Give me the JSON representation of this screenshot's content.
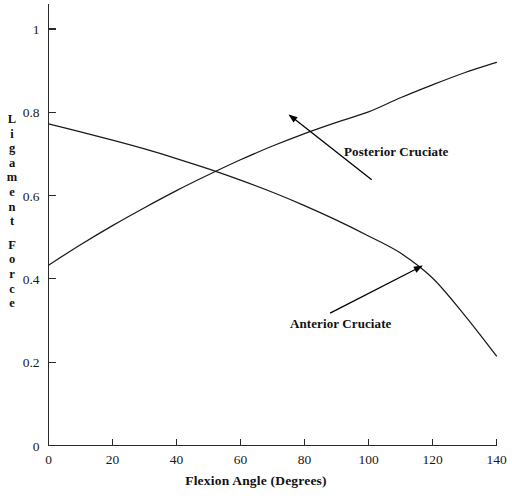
{
  "chart_data": {
    "type": "line",
    "title": "",
    "xlabel": "Flexion Angle (Degrees)",
    "ylabel": "Ligament Force",
    "xlim": [
      0,
      140
    ],
    "ylim": [
      0,
      1
    ],
    "grid": false,
    "legend_position": "inline-annotations",
    "x_ticks": [
      0,
      20,
      40,
      60,
      80,
      100,
      120,
      140
    ],
    "x_tick_labels": [
      "0",
      "20",
      "40",
      "60",
      "80",
      "100",
      "120",
      "140"
    ],
    "y_ticks": [
      0,
      0.2,
      0.4,
      0.6,
      0.8,
      1
    ],
    "y_tick_labels": [
      "0",
      "0.2",
      "0.4",
      "0.6",
      "0.8",
      "1"
    ],
    "x": [
      0,
      10,
      20,
      30,
      40,
      50,
      60,
      70,
      80,
      90,
      100,
      110,
      120,
      130,
      140
    ],
    "series": [
      {
        "name": "Posterior Cruciate",
        "values": [
          0.433,
          0.482,
          0.528,
          0.571,
          0.612,
          0.65,
          0.686,
          0.719,
          0.749,
          0.776,
          0.801,
          0.835,
          0.866,
          0.895,
          0.92
        ]
      },
      {
        "name": "Anterior Cruciate",
        "values": [
          0.772,
          0.753,
          0.733,
          0.712,
          0.689,
          0.664,
          0.637,
          0.608,
          0.576,
          0.541,
          0.503,
          0.462,
          0.402,
          0.313,
          0.215
        ]
      }
    ],
    "annotations": [
      {
        "label": "Posterior Cruciate",
        "points_to": {
          "x": 75,
          "y": 0.795
        },
        "label_x": 101,
        "label_y": 0.638
      },
      {
        "label": "Anterior Cruciate",
        "points_to": {
          "x": 117,
          "y": 0.432
        },
        "label_x": 88,
        "label_y": 0.318
      }
    ],
    "crossing_point": {
      "x": 44,
      "y": 0.67
    }
  },
  "axis": {
    "y_label_chars": [
      "L",
      "i",
      "g",
      "a",
      "m",
      "e",
      "n",
      "t",
      "",
      "F",
      "o",
      "r",
      "c",
      "e"
    ]
  }
}
